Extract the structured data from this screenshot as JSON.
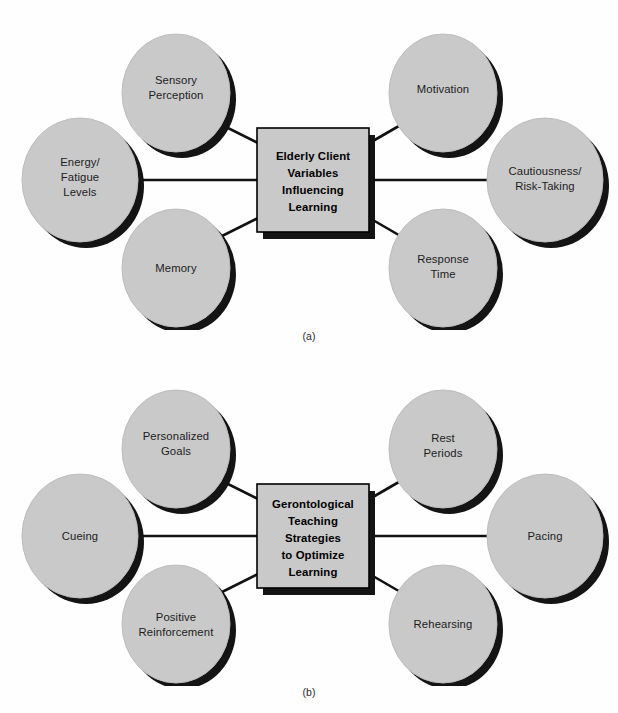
{
  "figure": {
    "style": {
      "node_fill": "#c9c9c9",
      "node_stroke": "#b4b4b4",
      "shadow": "#141414",
      "box_fill": "#c9c9c9",
      "box_stroke": "#000000",
      "connector": "#111111",
      "background": "#fefefe"
    },
    "panels": [
      {
        "id": "a",
        "caption": "(a)",
        "center": {
          "name": "elderly-client-variables-box",
          "lines": [
            "Elderly Client",
            "Variables",
            "Influencing",
            "Learning"
          ]
        },
        "nodes": [
          {
            "name": "sensory-perception",
            "lines": [
              "Sensory",
              "Perception"
            ],
            "position": "top-left"
          },
          {
            "name": "energy-fatigue-levels",
            "lines": [
              "Energy/",
              "Fatigue",
              "Levels"
            ],
            "position": "mid-left"
          },
          {
            "name": "memory",
            "lines": [
              "Memory"
            ],
            "position": "bottom-left"
          },
          {
            "name": "motivation",
            "lines": [
              "Motivation"
            ],
            "position": "top-right"
          },
          {
            "name": "cautiousness-risk-taking",
            "lines": [
              "Cautiousness/",
              "Risk-Taking"
            ],
            "position": "mid-right"
          },
          {
            "name": "response-time",
            "lines": [
              "Response",
              "Time"
            ],
            "position": "bottom-right"
          }
        ]
      },
      {
        "id": "b",
        "caption": "(b)",
        "center": {
          "name": "gerontological-teaching-strategies-box",
          "lines": [
            "Gerontological",
            "Teaching",
            "Strategies",
            "to Optimize",
            "Learning"
          ]
        },
        "nodes": [
          {
            "name": "personalized-goals",
            "lines": [
              "Personalized",
              "Goals"
            ],
            "position": "top-left"
          },
          {
            "name": "cueing",
            "lines": [
              "Cueing"
            ],
            "position": "mid-left"
          },
          {
            "name": "positive-reinforcement",
            "lines": [
              "Positive",
              "Reinforcement"
            ],
            "position": "bottom-left"
          },
          {
            "name": "rest-periods",
            "lines": [
              "Rest",
              "Periods"
            ],
            "position": "top-right"
          },
          {
            "name": "pacing",
            "lines": [
              "Pacing"
            ],
            "position": "mid-right"
          },
          {
            "name": "rehearsing",
            "lines": [
              "Rehearsing"
            ],
            "position": "bottom-right"
          }
        ]
      }
    ]
  }
}
